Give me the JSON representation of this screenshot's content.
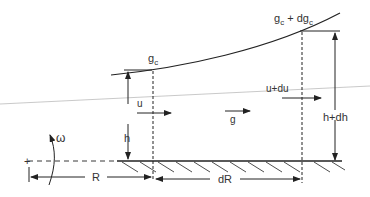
{
  "diagram": {
    "labels": {
      "gc": "g",
      "gc_sub": "c",
      "gc_dgc": "g",
      "gc_dgc_sub": "c",
      "gc_dgc_plus": " + dg",
      "gc_dgc_sub2": "c",
      "u": "u",
      "u_du": "u+du",
      "g": "g",
      "h": "h",
      "h_dh": "h+dh",
      "omega": "ω",
      "R": "R",
      "dR": "dR",
      "origin": "+"
    },
    "colors": {
      "line": "#222222",
      "text": "#333333",
      "thin_line": "#bbbbbb"
    }
  }
}
